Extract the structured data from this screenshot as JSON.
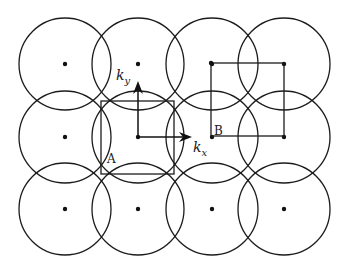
{
  "diagram": {
    "colors": {
      "stroke": "#1c1c1c",
      "background": "#ffffff"
    },
    "grid": {
      "columns_x": [
        65,
        138,
        212,
        284
      ],
      "rows_y": [
        64,
        137,
        209
      ],
      "circle_radius": 46
    },
    "axes": {
      "kx": {
        "label_main": "k",
        "label_sub": "x"
      },
      "ky": {
        "label_main": "k",
        "label_sub": "y"
      },
      "origin": [
        138,
        137
      ]
    },
    "cells": [
      {
        "id": "A",
        "label": "A",
        "kind": "centered square (Wigner-Seitz)",
        "x": 101,
        "y": 101,
        "w": 73,
        "h": 73
      },
      {
        "id": "B",
        "label": "B",
        "kind": "square with lattice points at corners",
        "x": 211,
        "y": 63,
        "w": 73,
        "h": 73
      }
    ]
  }
}
